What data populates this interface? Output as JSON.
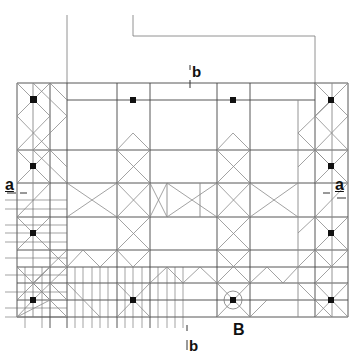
{
  "diagram": {
    "type": "architectural-grid-plan",
    "colors": {
      "background": "#ffffff",
      "line": "#555555",
      "heavy_line": "#333333",
      "diagonal": "#8a8a8a",
      "column": "#111111"
    },
    "labels": {
      "section_a_left": "a",
      "section_a_right": "a",
      "section_b_top": "b",
      "section_b_bottom": "b",
      "detail_marker": "B"
    },
    "grid": {
      "columns_x": [
        17,
        50,
        67,
        117,
        150,
        167,
        200,
        217,
        250,
        298,
        315,
        348
      ],
      "rows_y": [
        83,
        100,
        150,
        183,
        217,
        250,
        267,
        283,
        300,
        317
      ]
    }
  }
}
